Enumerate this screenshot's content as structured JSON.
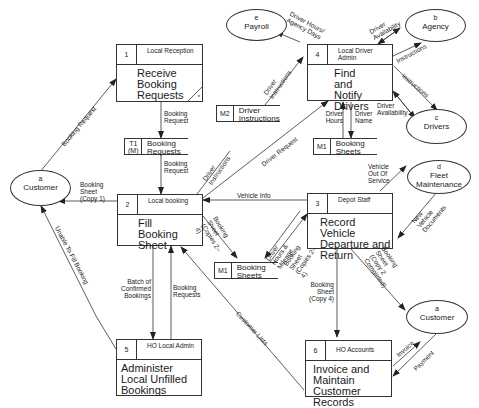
{
  "processes": [
    {
      "id": "1",
      "location": "Local Reception",
      "title": "Receive Booking Requests",
      "marker": "*"
    },
    {
      "id": "2",
      "location": "Local booking",
      "title": "Fill Booking Sheet"
    },
    {
      "id": "3",
      "location": "Depot Staff",
      "title": "Record Vehicle Departure and Return"
    },
    {
      "id": "4",
      "location": "Local Driver Admin",
      "title": "Find and Notify Drivers"
    },
    {
      "id": "5",
      "location": "HO Local Admin",
      "title": "Administer Local Unfilled Bookings"
    },
    {
      "id": "6",
      "location": "HO Accounts",
      "title": "Invoice and Maintain Customer Records"
    }
  ],
  "stores": [
    {
      "id": "T1 (M)",
      "label": "Booking Requests"
    },
    {
      "id": "M2",
      "label": "Driver Instructions"
    },
    {
      "id": "M1",
      "label": "Booking Sheets"
    },
    {
      "id": "M1",
      "label": "Booking Sheets"
    }
  ],
  "entities": [
    {
      "id": "a",
      "label": "Customer"
    },
    {
      "id": "e",
      "label": "Payroll"
    },
    {
      "id": "b",
      "label": "Agency"
    },
    {
      "id": "c",
      "label": "Drivers"
    },
    {
      "id": "d",
      "label": "Fleet Maintenance"
    },
    {
      "id": "a",
      "label": "Customer"
    }
  ],
  "flows": {
    "booking_request_in": "Booking Request",
    "booking_request_1_t1": "Booking Request",
    "booking_request_t1_2": "Booking Request",
    "booking_sheet_copy1": "Booking Sheet (Copy 1)",
    "driver_instructions_2": "Driver Instructions",
    "driver_request": "Driver Request",
    "driver_instructions_m2": "Driver Instructions",
    "driver_hours_payroll": "Driver Hours/ Agency Days",
    "driver_availability_agency": "Driver Availability",
    "instructions_agency": "Instructions",
    "instructions_drivers": "Instructions",
    "driver_availability_drivers": "Driver Availability",
    "driver_hours": "Driver Hours",
    "driver_name": "Driver Name",
    "vehicle_info": "Vehicle Info",
    "vehicle_out_of_service": "Vehicle Out Of Service",
    "new_vehicle_documents": "New Vehicle Documents",
    "booking_sheet_copies_2": "Booking Sheet (Copies 2–4)",
    "driver_hours_mileage": "Driver Hours & Mileage",
    "booking_sheet_copies_3": "Booking Sheet (Copies 2–4)",
    "booking_sheet_copy2_completed": "Booking Sheet (Copy 2 Completed)",
    "booking_sheet_copy4": "Booking Sheet (Copy 4)",
    "batch_confirmed": "Batch of Confirmed Bookings",
    "booking_requests_5": "Booking Requests",
    "unable_to_fill": "Unable To Fill Booking",
    "customer_lists": "Customer Lists",
    "invoice": "Invoice",
    "payment": "Payment"
  }
}
